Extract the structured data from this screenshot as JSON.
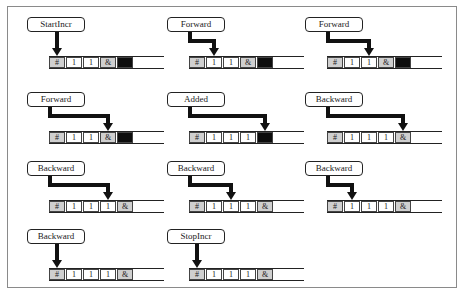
{
  "diagram": {
    "title": "",
    "colors": {
      "cell_marker": "#cfcfcf",
      "cell_blank_black": "#0d0d0d",
      "frame": "#8a8a8a",
      "ink": "#222222"
    },
    "panels": [
      {
        "label": "StartIncr",
        "cells": [
          "#",
          "1",
          "1",
          "&",
          "■"
        ],
        "head": 0,
        "pos": [
          27,
          17
        ]
      },
      {
        "label": "Forward",
        "cells": [
          "#",
          "1",
          "1",
          "&",
          "■"
        ],
        "head": 1,
        "pos": [
          167,
          17
        ]
      },
      {
        "label": "Forward",
        "cells": [
          "#",
          "1",
          "1",
          "&",
          "■"
        ],
        "head": 2,
        "pos": [
          305,
          17
        ]
      },
      {
        "label": "Forward",
        "cells": [
          "#",
          "1",
          "1",
          "&",
          "■"
        ],
        "head": 3,
        "pos": [
          27,
          92
        ]
      },
      {
        "label": "Added",
        "cells": [
          "#",
          "1",
          "1",
          "1",
          "■"
        ],
        "head": 4,
        "pos": [
          167,
          92
        ]
      },
      {
        "label": "Backward",
        "cells": [
          "#",
          "1",
          "1",
          "1",
          "&"
        ],
        "head": 4,
        "pos": [
          305,
          92
        ]
      },
      {
        "label": "Backward",
        "cells": [
          "#",
          "1",
          "1",
          "1",
          "&"
        ],
        "head": 3,
        "pos": [
          27,
          161
        ]
      },
      {
        "label": "Backward",
        "cells": [
          "#",
          "1",
          "1",
          "1",
          "&"
        ],
        "head": 2,
        "pos": [
          167,
          161
        ]
      },
      {
        "label": "Backward",
        "cells": [
          "#",
          "1",
          "1",
          "1",
          "&"
        ],
        "head": 1,
        "pos": [
          305,
          161
        ]
      },
      {
        "label": "Backward",
        "cells": [
          "#",
          "1",
          "1",
          "1",
          "&"
        ],
        "head": 0,
        "pos": [
          27,
          229
        ]
      },
      {
        "label": "StopIncr",
        "cells": [
          "#",
          "1",
          "1",
          "1",
          "&"
        ],
        "head": 0,
        "pos": [
          167,
          229
        ]
      }
    ],
    "legend": {
      "gray_cell": "tape marker symbols (# and &)",
      "black_cell": "blank/filled cell",
      "arrow": "read/write head position"
    }
  }
}
